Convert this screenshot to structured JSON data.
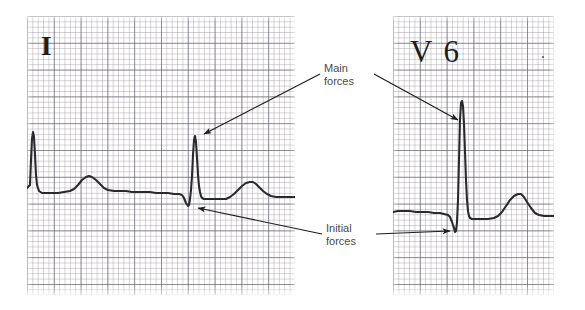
{
  "figure": {
    "type": "ecg-strip-comparison",
    "width": 585,
    "height": 310,
    "background_color": "#ffffff",
    "trace_color": "#2a2a2e",
    "grid_bold_color": "#60606c",
    "grid_fine_color": "#968c94",
    "annotation_color": "#4a4a4a"
  },
  "panels": [
    {
      "id": "lead-i",
      "lead_label": "I",
      "grid": {
        "small_square_px": 5.36,
        "bold_every": 5
      }
    },
    {
      "id": "lead-v6",
      "lead_label": "V 6",
      "grid": {
        "small_square_px": 5.36,
        "bold_every": 5
      }
    }
  ],
  "annotations": [
    {
      "id": "main-forces",
      "text": "Main\nforces",
      "line1": "Main",
      "line2": "forces",
      "points_to": [
        "lead-i R wave peak",
        "lead-v6 R wave peak"
      ]
    },
    {
      "id": "initial-forces",
      "text": "Initial\nforces",
      "line1": "Initial",
      "line2": "forces",
      "points_to": [
        "lead-i Q wave",
        "lead-v6 Q wave"
      ]
    }
  ],
  "chart_data": {
    "type": "line",
    "title": "",
    "xlabel": "",
    "ylabel": "",
    "grid": true,
    "legend": "none",
    "series": [
      {
        "name": "Lead I",
        "panel": "lead-i",
        "comment": "Two beats: tall narrow R waves with broad T waves; second beat shows small initial Q deflection.",
        "points": "27,188 30,185 31,160 32,139 33,132 34,137 35,155 36,175 37,185 39,191 42,193 46,193 52,193 58,193 64,192 70,191 74,189 78,185 82,180 86,177 89,176 92,177 96,180 100,184 104,188 108,190 114,191 120,191 126,191 132,192 138,192 144,192 150,192 156,193 162,193 168,193 174,194 179,194 182,195 184,198 186,203 188,206 189,205 190,199 191,190 192,176 193,155 194,140 195,136 196,142 197,158 198,175 199,186 200,192 201,196 202,198 204,199 208,199 214,199 220,199 226,199 230,197 234,194 238,190 242,186 246,183 250,182 253,182 256,184 259,187 263,191 267,194 271,196 276,197 282,197 290,197 295,197"
      },
      {
        "name": "Lead V6",
        "panel": "lead-v6",
        "comment": "Single beat: small Q dip then very tall narrow R wave, then broad T wave.",
        "points": "393,212 398,211 404,211 410,211 416,212 422,212 428,212 434,213 440,213 444,214 448,215 450,217 452,222 454,228 455,232 456,231 457,222 458,200 459,160 460,120 461,103 462,101 463,106 464,124 465,152 466,180 467,200 468,211 469,216 470,218 472,219 476,219 482,219 488,219 494,218 498,216 502,212 506,206 510,200 514,196 518,194 521,194 524,197 527,202 531,208 535,213 539,215 544,216 549,216 554,216"
      }
    ],
    "arrows": [
      {
        "id": "arrow-main-to-lead-i",
        "from": [
          320,
          74
        ],
        "to": [
          204,
          134
        ]
      },
      {
        "id": "arrow-main-to-lead-v6",
        "from": [
          374,
          74
        ],
        "to": [
          458,
          120
        ]
      },
      {
        "id": "arrow-initial-to-lead-i",
        "from": [
          322,
          234
        ],
        "to": [
          198,
          208
        ]
      },
      {
        "id": "arrow-initial-to-lead-v6",
        "from": [
          376,
          234
        ],
        "to": [
          450,
          231
        ]
      }
    ]
  }
}
